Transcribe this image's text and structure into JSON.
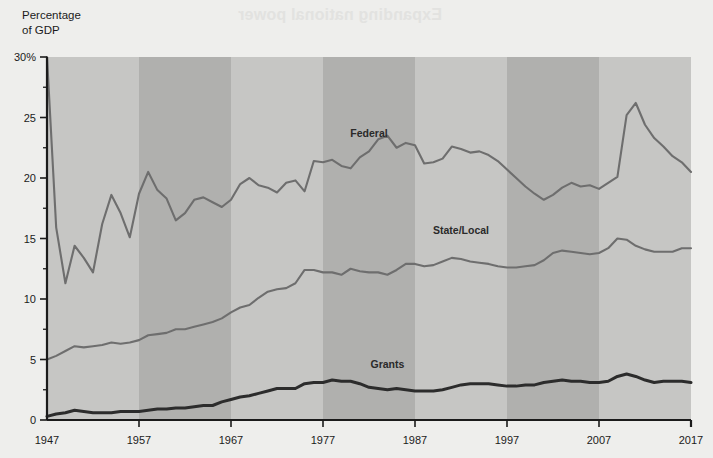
{
  "page": {
    "background_color": "#eeeeec",
    "bleed_through_text": "Expanding national power"
  },
  "axis_title": "Percentage\nof GDP",
  "chart_data": {
    "type": "line",
    "title": "",
    "subtitle": "",
    "xlabel": "",
    "ylabel": "Percentage of GDP",
    "xlim": [
      1947,
      2017
    ],
    "ylim": [
      0,
      30
    ],
    "grid": false,
    "legend_position": "inline-annotations",
    "y_ticks": [
      0,
      5,
      10,
      15,
      20,
      25,
      30
    ],
    "y_tick_labels": [
      "0",
      "5",
      "10",
      "15",
      "20",
      "25",
      "30%"
    ],
    "y_minor_ticks": [
      2.5,
      7.5,
      12.5,
      17.5,
      22.5,
      27.5
    ],
    "x_ticks": [
      1947,
      1957,
      1967,
      1977,
      1987,
      1997,
      2007,
      2017
    ],
    "x_tick_labels": [
      "1947",
      "1957",
      "1967",
      "1977",
      "1987",
      "1997",
      "2007",
      "2017"
    ],
    "decade_bands": [
      {
        "from": 1947,
        "to": 1957,
        "shade": "light"
      },
      {
        "from": 1957,
        "to": 1967,
        "shade": "dark"
      },
      {
        "from": 1967,
        "to": 1977,
        "shade": "light"
      },
      {
        "from": 1977,
        "to": 1987,
        "shade": "dark"
      },
      {
        "from": 1987,
        "to": 1997,
        "shade": "light"
      },
      {
        "from": 1997,
        "to": 2007,
        "shade": "dark"
      },
      {
        "from": 2007,
        "to": 2017,
        "shade": "light"
      }
    ],
    "x": [
      1947,
      1948,
      1949,
      1950,
      1951,
      1952,
      1953,
      1954,
      1955,
      1956,
      1957,
      1958,
      1959,
      1960,
      1961,
      1962,
      1963,
      1964,
      1965,
      1966,
      1967,
      1968,
      1969,
      1970,
      1971,
      1972,
      1973,
      1974,
      1975,
      1976,
      1977,
      1978,
      1979,
      1980,
      1981,
      1982,
      1983,
      1984,
      1985,
      1986,
      1987,
      1988,
      1989,
      1990,
      1991,
      1992,
      1993,
      1994,
      1995,
      1996,
      1997,
      1998,
      1999,
      2000,
      2001,
      2002,
      2003,
      2004,
      2005,
      2006,
      2007,
      2008,
      2009,
      2010,
      2011,
      2012,
      2013,
      2014,
      2015,
      2016,
      2017
    ],
    "series": [
      {
        "name": "Federal",
        "label": "Federal",
        "color": "#6e6e6e",
        "line_width": 2.1,
        "label_x": 1982,
        "label_y": 23.4,
        "values": [
          30.0,
          15.9,
          11.3,
          14.4,
          13.4,
          12.2,
          16.2,
          18.6,
          17.1,
          15.1,
          18.7,
          20.5,
          19.0,
          18.3,
          16.5,
          17.1,
          18.2,
          18.4,
          18.0,
          17.6,
          18.2,
          19.5,
          20.0,
          19.4,
          19.2,
          18.8,
          19.6,
          19.8,
          18.9,
          21.4,
          21.3,
          21.5,
          21.0,
          20.8,
          21.7,
          22.2,
          23.2,
          23.5,
          22.5,
          22.9,
          22.7,
          21.2,
          21.3,
          21.6,
          22.6,
          22.4,
          22.1,
          22.2,
          21.9,
          21.4,
          20.7,
          20.0,
          19.3,
          18.7,
          18.2,
          18.6,
          19.2,
          19.6,
          19.3,
          19.4,
          19.1,
          19.6,
          20.1,
          25.2,
          26.2,
          24.4,
          23.3,
          22.6,
          21.8,
          21.3,
          20.5
        ]
      },
      {
        "name": "State/Local",
        "label": "State/Local",
        "color": "#6e6e6e",
        "line_width": 2.1,
        "label_x": 1992,
        "label_y": 15.4,
        "values": [
          5.0,
          5.3,
          5.7,
          6.1,
          6.0,
          6.1,
          6.2,
          6.4,
          6.3,
          6.4,
          6.6,
          7.0,
          7.1,
          7.2,
          7.5,
          7.5,
          7.7,
          7.9,
          8.1,
          8.4,
          8.9,
          9.3,
          9.5,
          10.1,
          10.6,
          10.8,
          10.9,
          11.3,
          12.4,
          12.4,
          12.2,
          12.2,
          12.0,
          12.5,
          12.3,
          12.2,
          12.2,
          12.0,
          12.4,
          12.9,
          12.9,
          12.7,
          12.8,
          13.1,
          13.4,
          13.3,
          13.1,
          13.0,
          12.9,
          12.7,
          12.6,
          12.6,
          12.7,
          12.8,
          13.2,
          13.8,
          14.0,
          13.9,
          13.8,
          13.7,
          13.8,
          14.2,
          15.0,
          14.9,
          14.4,
          14.1,
          13.9,
          13.9,
          13.9,
          14.2,
          14.2
        ]
      },
      {
        "name": "Grants",
        "label": "Grants",
        "color": "#2c2c2c",
        "line_width": 3.0,
        "label_x": 1984,
        "label_y": 4.3,
        "values": [
          0.3,
          0.5,
          0.6,
          0.8,
          0.7,
          0.6,
          0.6,
          0.6,
          0.7,
          0.7,
          0.7,
          0.8,
          0.9,
          0.9,
          1.0,
          1.0,
          1.1,
          1.2,
          1.2,
          1.5,
          1.7,
          1.9,
          2.0,
          2.2,
          2.4,
          2.6,
          2.6,
          2.6,
          3.0,
          3.1,
          3.1,
          3.3,
          3.2,
          3.2,
          3.0,
          2.7,
          2.6,
          2.5,
          2.6,
          2.5,
          2.4,
          2.4,
          2.4,
          2.5,
          2.7,
          2.9,
          3.0,
          3.0,
          3.0,
          2.9,
          2.8,
          2.8,
          2.9,
          2.9,
          3.1,
          3.2,
          3.3,
          3.2,
          3.2,
          3.1,
          3.1,
          3.2,
          3.6,
          3.8,
          3.6,
          3.3,
          3.1,
          3.2,
          3.2,
          3.2,
          3.1
        ]
      }
    ]
  },
  "colors": {
    "band_light": "#c6c6c4",
    "band_dark": "#b0b0ae",
    "axis": "#1b1b1b",
    "line_gray": "#6e6e6e",
    "line_dark": "#2c2c2c"
  }
}
